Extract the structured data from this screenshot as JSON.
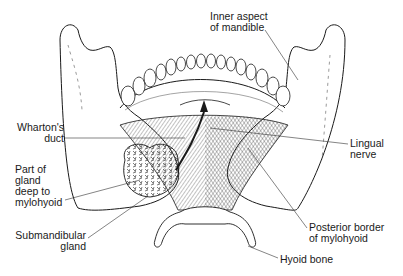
{
  "figure": {
    "labels": {
      "inner_aspect": "Inner aspect\nof mandible",
      "whartons_duct": "Wharton's\nduct",
      "lingual_nerve": "Lingual\nnerve",
      "part_of_gland": "Part of\ngland\ndeep to\nmylohyoid",
      "submandibular_gland": "Submandibular\ngland",
      "posterior_border": "Posterior border\nof mylohyoid",
      "hyoid_bone": "Hyoid bone"
    },
    "colors": {
      "ink": "#1a1a1a",
      "background": "#ffffff"
    }
  }
}
